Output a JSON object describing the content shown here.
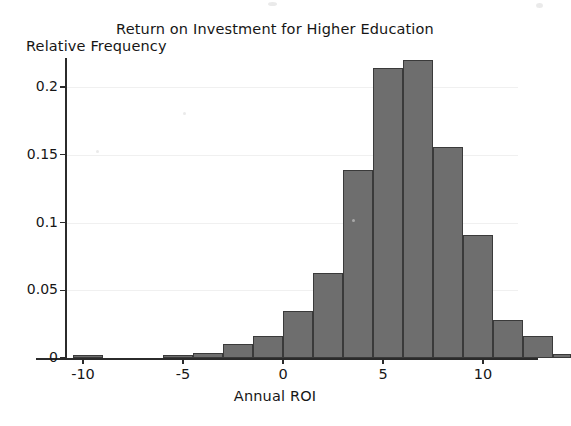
{
  "figure": {
    "title": "Return on Investment for Higher Education",
    "ylabel": "Relative Frequency",
    "xlabel": "Annual ROI"
  },
  "axes": {
    "x_ticks": [
      "-10",
      "-5",
      "0",
      "5",
      "10"
    ],
    "y_ticks": [
      "0",
      "0.05",
      "0.1",
      "0.15",
      "0.2"
    ]
  },
  "style": {
    "bar_fill": "#6e6e6e",
    "bar_edge": "#3a3a3a",
    "axis_color": "#2b2b2b",
    "grid_color": "#f0f0f0",
    "background": "#ffffff"
  },
  "chart_data": {
    "type": "bar",
    "title": "Return on Investment for Higher Education",
    "xlabel": "Annual ROI",
    "ylabel": "Relative Frequency",
    "xlim": [
      -11.5,
      13.5
    ],
    "ylim": [
      0,
      0.233
    ],
    "xtick_values": [
      -10,
      -5,
      0,
      5,
      10
    ],
    "ytick_values": [
      0,
      0.05,
      0.1,
      0.15,
      0.2
    ],
    "grid": true,
    "legend": null,
    "bin_width": 1.5,
    "bin_left_edges": [
      -10.5,
      -6.0,
      -4.5,
      -3.0,
      -1.5,
      0.0,
      1.5,
      3.0,
      4.5,
      6.0,
      7.5,
      9.0,
      10.5,
      12.0
    ],
    "bin_centers": [
      -9.75,
      -5.25,
      -3.75,
      -2.25,
      -0.75,
      0.75,
      2.25,
      3.75,
      5.25,
      6.75,
      8.25,
      9.75,
      11.25,
      12.75
    ],
    "values": [
      0.002,
      0.002,
      0.004,
      0.01,
      0.016,
      0.035,
      0.063,
      0.139,
      0.214,
      0.22,
      0.156,
      0.091,
      0.028,
      0.016
    ],
    "extra_bin": {
      "left_edge": 13.5,
      "center": 13.9,
      "value": 0.003
    },
    "categories": [
      "-9.75",
      "-5.25",
      "-3.75",
      "-2.25",
      "-0.75",
      "0.75",
      "2.25",
      "3.75",
      "5.25",
      "6.75",
      "8.25",
      "9.75",
      "11.25",
      "12.75"
    ]
  }
}
